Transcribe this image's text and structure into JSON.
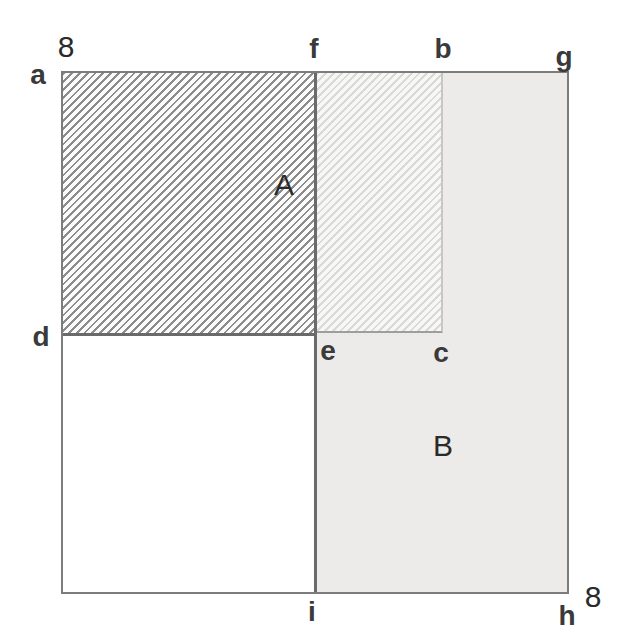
{
  "figure": {
    "side_length": "8",
    "labels": {
      "eight_top": "8",
      "eight_bottom": "8",
      "point_a": "a",
      "point_f": "f",
      "point_b": "b",
      "point_g": "g",
      "point_d": "d",
      "point_e": "e",
      "point_c": "c",
      "point_i": "i",
      "point_h": "h",
      "region_a": "A",
      "region_b": "B"
    },
    "colors": {
      "background": "#ffffff",
      "outer_border": "#7c7c7c",
      "region_a_hatch_line": "#8c8c8c",
      "region_a_border": "#6a6a6a",
      "region_b_fill": "#ecebe9",
      "overlap_hatch_line": "#d9d9d8",
      "divider_line": "#6a6a6a",
      "label_text": "#2e2e2e"
    }
  }
}
